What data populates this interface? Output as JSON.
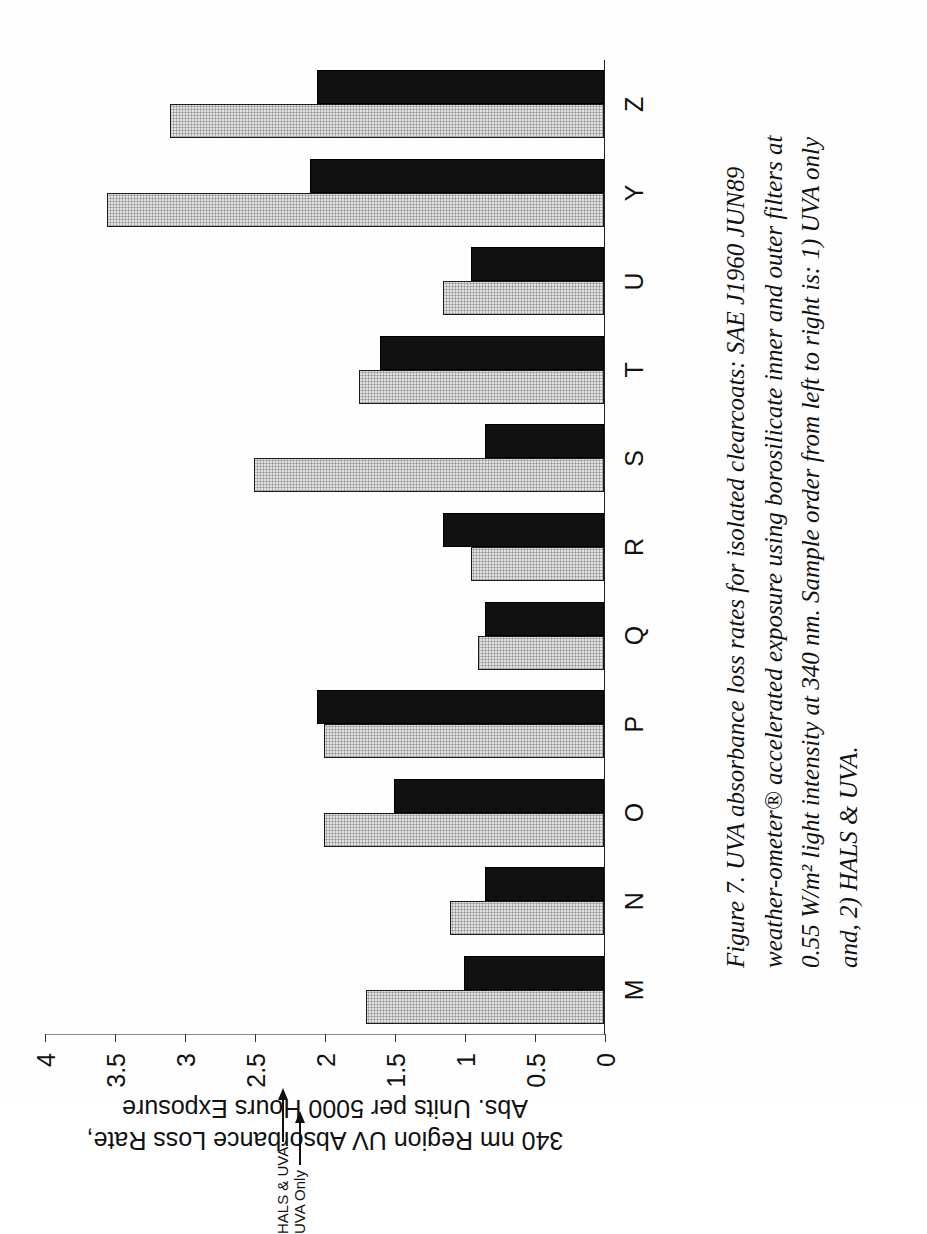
{
  "figure": {
    "caption_lines": [
      "Figure 7. UVA absorbance loss rates for isolated clearcoats: SAE J1960 JUN89",
      "weather-ometer® accelerated exposure using borosilicate inner and outer filters at",
      "0.55 W/m² light intensity at 340 nm.  Sample order from left to right is: 1) UVA only",
      "and, 2) HALS & UVA."
    ]
  },
  "annotations": {
    "uva_only": "UVA Only",
    "hals_uva": "HALS & UVA"
  },
  "axis": {
    "value_title_line1": "340 nm Region UV Absorbance Loss Rate,",
    "value_title_line2": "Abs. Units per 5000 Hours Exposure",
    "ticks": [
      "0",
      "0.5",
      "1",
      "1.5",
      "2",
      "2.5",
      "3",
      "3.5",
      "4"
    ]
  },
  "chart_data": {
    "type": "bar",
    "title": "",
    "xlabel": "",
    "ylabel": "340 nm Region UV Absorbance Loss Rate, Abs. Units per 5000 Hours Exposure",
    "ylim": [
      0,
      4
    ],
    "yticks": [
      0,
      0.5,
      1,
      1.5,
      2,
      2.5,
      3,
      3.5,
      4
    ],
    "grid": false,
    "legend_position": "annotated-arrows-at-category-O",
    "orientation": "vertical-bars-rotated-90",
    "categories": [
      "M",
      "N",
      "O",
      "P",
      "Q",
      "R",
      "S",
      "T",
      "U",
      "Y",
      "Z"
    ],
    "series": [
      {
        "name": "UVA Only",
        "color": "#e2e2e2",
        "values": [
          1.7,
          1.1,
          2.0,
          2.0,
          0.9,
          0.95,
          2.5,
          1.75,
          1.15,
          3.55,
          3.1
        ]
      },
      {
        "name": "HALS & UVA",
        "color": "#111111",
        "values": [
          1.0,
          0.85,
          1.5,
          2.05,
          0.85,
          1.15,
          0.85,
          1.6,
          0.95,
          2.1,
          2.05
        ]
      }
    ]
  }
}
